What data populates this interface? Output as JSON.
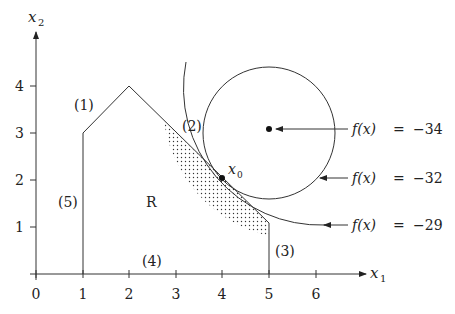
{
  "diagram": {
    "axes": {
      "x_label": "x",
      "x_sub": "1",
      "y_label": "x",
      "y_sub": "2",
      "x_ticks": [
        "0",
        "1",
        "2",
        "3",
        "4",
        "5",
        "6"
      ],
      "y_ticks": [
        "1",
        "2",
        "3",
        "4"
      ]
    },
    "region_label": "R",
    "constraint_labels": [
      "(1)",
      "(2)",
      "(3)",
      "(4)",
      "(5)"
    ],
    "point_label": "x",
    "point_sub": "0",
    "contours": [
      {
        "lhs": "f(x)",
        "eq": "=",
        "value": "−34"
      },
      {
        "lhs": "f(x)",
        "eq": "=",
        "value": "−32"
      },
      {
        "lhs": "f(x)",
        "eq": "=",
        "value": "−29"
      }
    ]
  }
}
